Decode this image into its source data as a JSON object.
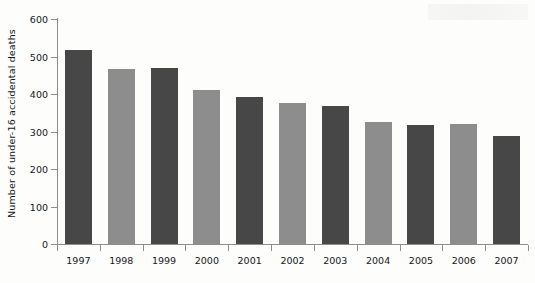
{
  "chart_data": {
    "type": "bar",
    "title": "",
    "subtitle": "",
    "xlabel": "",
    "ylabel": "Number of under-16 accidental deaths",
    "categories": [
      "1997",
      "1998",
      "1999",
      "2000",
      "2001",
      "2002",
      "2003",
      "2004",
      "2005",
      "2006",
      "2007"
    ],
    "values": [
      518,
      466,
      469,
      412,
      391,
      376,
      369,
      325,
      318,
      320,
      288
    ],
    "ylim": [
      0,
      600
    ],
    "ytick_values": [
      0,
      100,
      200,
      300,
      400,
      500,
      600
    ],
    "ytick_labels": [
      "0",
      "100",
      "200",
      "300",
      "400",
      "500",
      "600"
    ],
    "grid": false,
    "legend": null,
    "legend_position": "none",
    "bar_colors": [
      "#474747",
      "#8d8d8d",
      "#474747",
      "#8d8d8d",
      "#474747",
      "#8d8d8d",
      "#474747",
      "#8d8d8d",
      "#474747",
      "#8d8d8d",
      "#474747"
    ],
    "colors": {
      "bar_dark": "#474747",
      "bar_light": "#8d8d8d",
      "axis": "#8e8e8e",
      "text": "#15161a",
      "background": "#fdfdfc"
    }
  }
}
